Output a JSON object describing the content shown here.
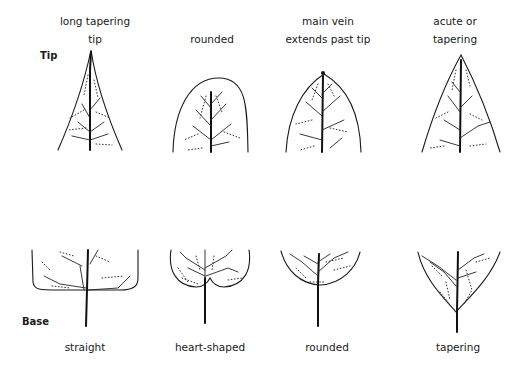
{
  "row_labels": {
    "tip": "Tip",
    "base": "Base"
  },
  "tip_shapes": [
    {
      "id": "long-tapering-tip",
      "lines": [
        "long tapering",
        "tip"
      ]
    },
    {
      "id": "rounded-tip",
      "lines": [
        "",
        "rounded"
      ]
    },
    {
      "id": "main-vein-extends-past-tip",
      "lines": [
        "main vein",
        "extends past tip"
      ]
    },
    {
      "id": "acute-or-tapering-tip",
      "lines": [
        "acute or",
        "tapering"
      ]
    }
  ],
  "base_shapes": [
    {
      "id": "straight-base",
      "label": "straight"
    },
    {
      "id": "heart-shaped-base",
      "label": "heart-shaped"
    },
    {
      "id": "rounded-base",
      "label": "rounded"
    },
    {
      "id": "tapering-base",
      "label": "tapering"
    }
  ]
}
